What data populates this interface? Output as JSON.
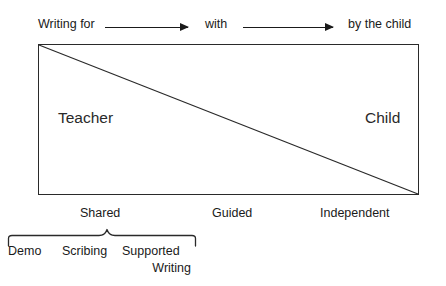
{
  "diagram": {
    "continuum": {
      "stages": [
        {
          "id": "writing-for",
          "label": "Writing for"
        },
        {
          "id": "with",
          "label": "with"
        },
        {
          "id": "by-the-child",
          "label": "by the child"
        }
      ],
      "arrows": [
        {
          "id": "arrow-1",
          "from": "Writing for",
          "to": "with",
          "direction": "right"
        },
        {
          "id": "arrow-2",
          "from": "with",
          "to": "by the child",
          "direction": "right"
        }
      ]
    },
    "box": {
      "left_label": "Teacher",
      "right_label": "Child",
      "divider": "diagonal-top-left-to-bottom-right"
    },
    "modes": [
      {
        "id": "shared",
        "label": "Shared"
      },
      {
        "id": "guided",
        "label": "Guided"
      },
      {
        "id": "independent",
        "label": "Independent"
      }
    ],
    "bracket_group": {
      "bracket": "upward-curly-brace",
      "items": [
        {
          "id": "demo",
          "label": "Demo"
        },
        {
          "id": "scribing",
          "label": "Scribing"
        },
        {
          "id": "supported-writing",
          "label": "Supported",
          "label_line2": "Writing"
        }
      ]
    },
    "colors": {
      "ink": "#1a1a1a",
      "stroke": "#2a2a2a",
      "background": "#ffffff"
    }
  }
}
